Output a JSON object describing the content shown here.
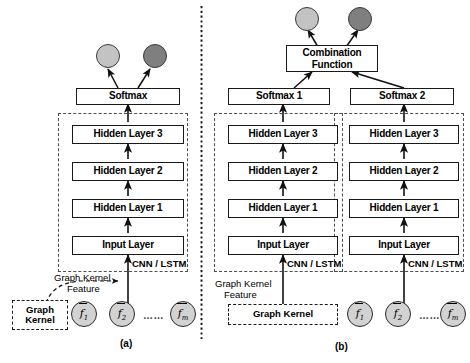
{
  "figure": {
    "caption_a": "(a)",
    "caption_b": "(b)",
    "colors": {
      "node_light": "#c3c3c3",
      "node_dark": "#7f7f7f",
      "feature_circle": "#d2d2d2",
      "box_border": "#1a1a1a",
      "dashed_border": "#4d4d4d",
      "divider": "#1a1a1a",
      "background": "#ffffff"
    }
  },
  "panel_a": {
    "caption": "(a)",
    "output_nodes": [
      {
        "name": "class-node-light",
        "color": "#c3c3c3"
      },
      {
        "name": "class-node-dark",
        "color": "#7f7f7f"
      }
    ],
    "softmax_label": "Softmax",
    "stack": [
      "Hidden Layer 3",
      "Hidden Layer 2",
      "Hidden Layer 1",
      "Input Layer"
    ],
    "encoder_label": "CNN / LSTM",
    "graph_kernel_feature_label_line1": "Graph Kernel",
    "graph_kernel_feature_label_line2": "Feature",
    "graph_kernel_box_line1": "Graph",
    "graph_kernel_box_line2": "Kernel",
    "features": [
      {
        "symbol": "f",
        "subscript": "1"
      },
      {
        "symbol": "f",
        "subscript": "2"
      },
      {
        "symbol": "f",
        "subscript": "m"
      }
    ],
    "feature_ellipsis": "……"
  },
  "panel_b": {
    "caption": "(b)",
    "output_nodes": [
      {
        "name": "class-node-light",
        "color": "#c3c3c3"
      },
      {
        "name": "class-node-dark",
        "color": "#7f7f7f"
      }
    ],
    "combination_label_line1": "Combination",
    "combination_label_line2": "Function",
    "softmax_left_label": "Softmax 1",
    "softmax_right_label": "Softmax 2",
    "stack_left": [
      "Hidden Layer 3",
      "Hidden Layer 2",
      "Hidden Layer 1",
      "Input Layer"
    ],
    "stack_right": [
      "Hidden Layer 3",
      "Hidden Layer 2",
      "Hidden Layer 1",
      "Input Layer"
    ],
    "encoder_label_left": "CNN / LSTM",
    "encoder_label_right": "CNN / LSTM",
    "graph_kernel_feature_label_line1": "Graph Kernel",
    "graph_kernel_feature_label_line2": "Feature",
    "graph_kernel_box_label": "Graph Kernel",
    "features": [
      {
        "symbol": "f",
        "subscript": "1"
      },
      {
        "symbol": "f",
        "subscript": "2"
      },
      {
        "symbol": "f",
        "subscript": "m"
      }
    ],
    "feature_ellipsis": "……"
  }
}
